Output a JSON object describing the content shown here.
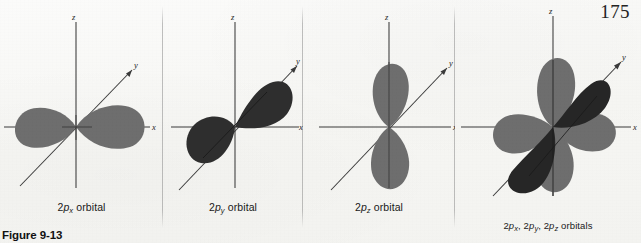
{
  "page": {
    "number": "175",
    "figure_label": "Figure 9-13",
    "background_color": "#f8f8f6"
  },
  "axes": {
    "z_label": "z",
    "y_label": "y",
    "x_label": "x",
    "axis_color": "#3a3a3a"
  },
  "colors": {
    "lobe_light": "#6e6e6e",
    "lobe_dark": "#262626",
    "axis": "#3a3a3a",
    "text": "#191919"
  },
  "panels": [
    {
      "id": "px",
      "caption_prefix": "2",
      "caption_p": "p",
      "caption_sub": "x",
      "caption_suffix": " orbital",
      "caption_plain": "2px orbital",
      "orbital": "2p_x",
      "lobe_axis": "x",
      "lobe_count": 2,
      "lobe_shade": "light"
    },
    {
      "id": "py",
      "caption_prefix": "2",
      "caption_p": "p",
      "caption_sub": "y",
      "caption_suffix": " orbital",
      "caption_plain": "2py orbital",
      "orbital": "2p_y",
      "lobe_axis": "y",
      "lobe_count": 2,
      "lobe_shade": "dark"
    },
    {
      "id": "pz",
      "caption_prefix": "2",
      "caption_p": "p",
      "caption_sub": "z",
      "caption_suffix": " orbital",
      "caption_plain": "2pz orbital",
      "orbital": "2p_z",
      "lobe_axis": "z",
      "lobe_count": 2,
      "lobe_shade": "light"
    },
    {
      "id": "all",
      "caption_plain": "2px, 2py, 2pz orbitals",
      "orbital": "2p_x, 2p_y, 2p_z",
      "lobe_axis": "x,y,z",
      "lobe_count": 6,
      "lobe_shade": "mixed"
    }
  ]
}
